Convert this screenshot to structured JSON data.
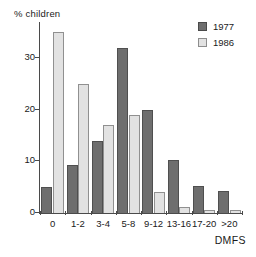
{
  "chart_data": {
    "type": "bar",
    "title": "",
    "xlabel": "DMFS",
    "ylabel": "% children",
    "categories": [
      "0",
      "1-2",
      "3-4",
      "5-8",
      "9-12",
      "13-16",
      "17-20",
      ">20"
    ],
    "series": [
      {
        "name": "1977",
        "color": "#6e6e6e",
        "values": [
          5,
          9.3,
          14,
          32,
          20,
          10.2,
          5.2,
          4.2
        ]
      },
      {
        "name": "1986",
        "color": "#e2e2e2",
        "values": [
          35,
          25,
          17,
          19,
          4.1,
          1.1,
          0.5,
          0.5
        ]
      }
    ],
    "ylim": [
      0,
      37
    ],
    "yticks": [
      0,
      10,
      20,
      30
    ],
    "ytick_labels": [
      "0",
      "10",
      "20",
      "30"
    ],
    "grid": false,
    "legend_position": "top-right"
  },
  "axes": {
    "y_title": "% children",
    "x_title": "DMFS"
  },
  "legend": {
    "entries": [
      {
        "label": "1977",
        "swatch": "dark-gray"
      },
      {
        "label": "1986",
        "swatch": "light-gray"
      }
    ]
  }
}
